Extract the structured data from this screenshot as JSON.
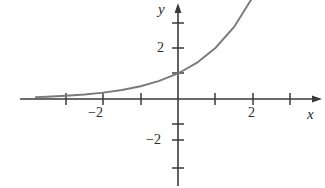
{
  "figure": {
    "name": "exponential-function-graph",
    "background_color": "#ffffff",
    "axis_color": "#3a3a3a",
    "curve_color": "#7a7a7a"
  },
  "labels": {
    "y_axis": "y",
    "x_axis": "x",
    "x_tick_neg2": "−2",
    "x_tick_pos2": "2",
    "y_tick_pos2": "2",
    "y_tick_neg2": "−2"
  },
  "chart_data": {
    "type": "line",
    "title": "",
    "xlabel": "x",
    "ylabel": "y",
    "xlim": [
      -3.8,
      3.8
    ],
    "ylim": [
      -2.9,
      2.6
    ],
    "grid": false,
    "legend": null,
    "axes": {
      "x_axis_y_value": 0,
      "y_axis_x_value": 0,
      "x_ticks": [
        -3,
        -2,
        -1,
        1,
        2,
        3
      ],
      "x_tick_labels": [
        "",
        "−2",
        "",
        "",
        "2",
        ""
      ],
      "y_ticks": [
        -2,
        -1,
        1,
        2
      ],
      "y_tick_labels": [
        "−2",
        "",
        "",
        "2"
      ],
      "x_arrow": true,
      "y_arrow": true,
      "x_axis_extends_left": true,
      "y_axis_extends_down": true
    },
    "series": [
      {
        "name": "y = 2^x",
        "equation": "y = 2^x",
        "x": [
          -3.8,
          -3.5,
          -3.0,
          -2.5,
          -2.0,
          -1.5,
          -1.0,
          -0.5,
          0.0,
          0.5,
          1.0,
          1.5,
          2.0,
          2.5,
          3.0,
          3.2
        ],
        "y": [
          0.0717,
          0.0884,
          0.125,
          0.177,
          0.25,
          0.354,
          0.5,
          0.707,
          1.0,
          1.414,
          2.0,
          2.828,
          4.0,
          5.657,
          8.0,
          9.19
        ],
        "y_intercept": 1.0,
        "asymptote": 0,
        "visible_x_start": -3.8,
        "visible_x_end": 1.32
      }
    ]
  }
}
